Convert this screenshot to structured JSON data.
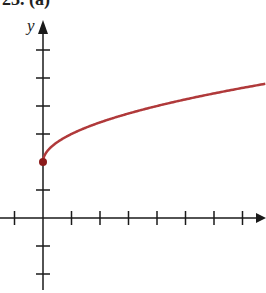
{
  "header": {
    "partial_title": "23. (a)"
  },
  "chart_data": {
    "type": "line",
    "title": "",
    "xlabel": "",
    "ylabel": "y",
    "function": "y = sqrt(x) + 2",
    "xlim": [
      -1.5,
      7.9
    ],
    "ylim": [
      -2.6,
      7
    ],
    "x_ticks": [
      -1,
      1,
      2,
      3,
      4,
      5,
      6,
      7
    ],
    "y_ticks": [
      -2,
      -1,
      1,
      3,
      4,
      5,
      6
    ],
    "tick_labels_shown": false,
    "grid": false,
    "legend": null,
    "start_point": {
      "x": 0,
      "y": 2,
      "filled": true
    },
    "series": [
      {
        "name": "curve",
        "color": "#b0393a",
        "x": [
          0,
          0.25,
          0.5,
          1,
          2,
          3,
          4,
          5,
          6,
          7,
          7.8
        ],
        "y": [
          2,
          2.5,
          2.71,
          3,
          3.41,
          3.73,
          4,
          4.24,
          4.45,
          4.65,
          4.79
        ]
      }
    ],
    "colors": {
      "axis": "#1a1a1a",
      "curve": "#b0393a",
      "point": "#8b1a1a"
    }
  }
}
